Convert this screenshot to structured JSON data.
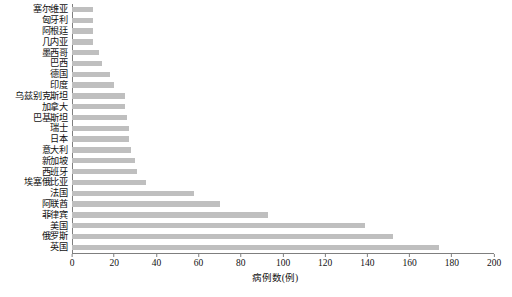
{
  "chart_data": {
    "type": "bar",
    "orientation": "horizontal",
    "title": "",
    "xlabel": "病例数(例)",
    "ylabel": "",
    "xlim": [
      0,
      200
    ],
    "xticks": [
      0,
      20,
      40,
      60,
      80,
      100,
      120,
      140,
      160,
      180,
      200
    ],
    "grid": false,
    "legend": null,
    "bar_color": "#bfbfbf",
    "categories": [
      "塞尔维亚",
      "匈牙利",
      "阿根廷",
      "几内亚",
      "墨西哥",
      "巴西",
      "德国",
      "印度",
      "乌兹别克斯坦",
      "加拿大",
      "巴基斯坦",
      "瑞士",
      "日本",
      "意大利",
      "新加坡",
      "西班牙",
      "埃塞俄比亚",
      "法国",
      "阿联酋",
      "菲律宾",
      "美国",
      "俄罗斯",
      "英国"
    ],
    "values": [
      10,
      10,
      10,
      10,
      13,
      14,
      18,
      20,
      25,
      25,
      26,
      27,
      27,
      28,
      30,
      31,
      35,
      58,
      70,
      93,
      139,
      152,
      174
    ]
  },
  "caption": {
    "text": ""
  }
}
